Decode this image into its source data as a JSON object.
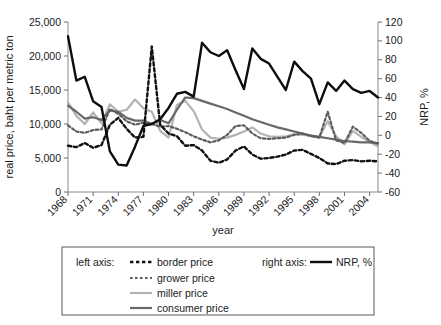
{
  "chart_data": {
    "type": "line",
    "title": "",
    "xlabel": "year",
    "ylabel": "real price, baht per metric ton",
    "y2label": "NRP, %",
    "xlim": [
      1968,
      2005
    ],
    "ylim": [
      0,
      25000
    ],
    "y2lim": [
      -60,
      120
    ],
    "grid": false,
    "legend_position": "bottom",
    "x_tick_labels": [
      "1968",
      "1971",
      "1974",
      "1977",
      "1980",
      "1983",
      "1986",
      "1989",
      "1992",
      "1995",
      "1998",
      "2001",
      "2004"
    ],
    "x_tick_values": [
      1968,
      1971,
      1974,
      1977,
      1980,
      1983,
      1986,
      1989,
      1992,
      1995,
      1998,
      2001,
      2004
    ],
    "y_tick_labels": [
      "0",
      "5,000",
      "10,000",
      "15,000",
      "20,000",
      "25,000"
    ],
    "y_tick_values": [
      0,
      5000,
      10000,
      15000,
      20000,
      25000
    ],
    "y2_tick_labels": [
      "-60",
      "-40",
      "-20",
      "0",
      "20",
      "40",
      "60",
      "80",
      "100",
      "120"
    ],
    "y2_tick_values": [
      -60,
      -40,
      -20,
      0,
      20,
      40,
      60,
      80,
      100,
      120
    ],
    "x": [
      1968,
      1969,
      1970,
      1971,
      1972,
      1973,
      1974,
      1975,
      1976,
      1977,
      1978,
      1979,
      1980,
      1981,
      1982,
      1983,
      1984,
      1985,
      1986,
      1987,
      1988,
      1989,
      1990,
      1991,
      1992,
      1993,
      1994,
      1995,
      1996,
      1997,
      1998,
      1999,
      2000,
      2001,
      2002,
      2003,
      2004,
      2005
    ],
    "series": [
      {
        "name": "border price",
        "axis": "left",
        "color": "#111111",
        "style": "dotted",
        "width": 2.4,
        "values": [
          6800,
          6600,
          7200,
          6500,
          6900,
          9900,
          10900,
          9300,
          8000,
          8100,
          21400,
          9900,
          8600,
          8200,
          6800,
          6900,
          6100,
          4600,
          4300,
          4800,
          6100,
          6700,
          5500,
          4900,
          5000,
          5200,
          5500,
          6100,
          6200,
          5600,
          5000,
          4200,
          4100,
          4600,
          4700,
          4500,
          4600,
          4500
        ]
      },
      {
        "name": "grower price",
        "axis": "left",
        "color": "#5c5c5c",
        "style": "dotted",
        "width": 2.2,
        "values": [
          9800,
          8900,
          8700,
          9100,
          9200,
          12200,
          11500,
          10400,
          9900,
          10200,
          10000,
          9600,
          9700,
          9300,
          8800,
          8200,
          7700,
          7300,
          7600,
          8400,
          9700,
          9800,
          8600,
          7900,
          7800,
          7900,
          8000,
          8400,
          8600,
          8200,
          8000,
          11800,
          7600,
          7200,
          9600,
          8700,
          7500,
          7100
        ]
      },
      {
        "name": "miller price",
        "axis": "left",
        "color": "#b3b3b3",
        "style": "solid",
        "width": 2.2,
        "values": [
          13200,
          11200,
          10000,
          11700,
          10100,
          12900,
          11800,
          12100,
          13600,
          12300,
          11800,
          9000,
          8000,
          12800,
          13400,
          11900,
          9200,
          8000,
          7800,
          8000,
          8400,
          8900,
          9500,
          8600,
          8200,
          8100,
          8200,
          8500,
          8400,
          8300,
          8100,
          10400,
          8200,
          7000,
          9000,
          8100,
          7400,
          6700
        ]
      },
      {
        "name": "consumer price",
        "axis": "left",
        "color": "#686868",
        "style": "solid",
        "width": 2.2,
        "values": [
          12700,
          11800,
          10800,
          11000,
          10600,
          12000,
          11800,
          10900,
          10500,
          10500,
          10000,
          10600,
          10100,
          12100,
          13900,
          13800,
          13400,
          13000,
          12600,
          12200,
          11700,
          11200,
          10700,
          10300,
          9900,
          9500,
          9200,
          8900,
          8600,
          8300,
          8100,
          7900,
          7700,
          7500,
          7400,
          7300,
          7300,
          7200
        ]
      },
      {
        "name": "NRP, %",
        "axis": "right",
        "color": "#0d0d0d",
        "style": "solid",
        "width": 2.4,
        "values": [
          105,
          58,
          62,
          36,
          30,
          -17,
          -31,
          -32,
          -12,
          10,
          12,
          17,
          29,
          44,
          46,
          41,
          98,
          88,
          84,
          90,
          69,
          49,
          92,
          81,
          76,
          62,
          48,
          78,
          68,
          60,
          33,
          56,
          47,
          58,
          49,
          45,
          47,
          40
        ]
      }
    ],
    "legend": {
      "left_axis_label": "left axis:",
      "right_axis_label": "right axis:",
      "left_entries": [
        "border price",
        "grower price",
        "miller price",
        "consumer price"
      ],
      "right_entries": [
        "NRP, %"
      ]
    }
  }
}
